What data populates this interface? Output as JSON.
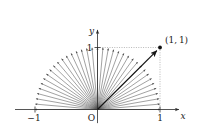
{
  "figure": {
    "background_color": "#ffffff",
    "ink_color": "#1a1a1a",
    "ray_color": "#555555",
    "guide_color": "#999999"
  },
  "axes": {
    "x_axis_label": "x",
    "y_axis_label": "y",
    "origin_label": "O",
    "x_ticks": [
      {
        "value": -1,
        "label": "−1"
      },
      {
        "value": 1,
        "label": "1"
      }
    ],
    "y_ticks": [
      {
        "value": 1,
        "label": "1"
      }
    ],
    "xlim": [
      -1.32,
      1.32
    ],
    "ylim": [
      -0.22,
      1.3
    ]
  },
  "point": {
    "label": "(1, 1)",
    "x": 1,
    "y": 1,
    "marker": "filled-dot"
  },
  "chart_data": {
    "type": "scatter",
    "title": "",
    "xlabel": "x",
    "ylabel": "y",
    "xlim": [
      -1.32,
      1.32
    ],
    "ylim": [
      -0.22,
      1.3
    ],
    "grid": false,
    "legend": null,
    "annotations": [
      {
        "text": "(1, 1)",
        "x": 1,
        "y": 1
      },
      {
        "text": "O",
        "x": 0,
        "y": 0
      },
      {
        "text": "−1",
        "x": -1,
        "y": 0
      },
      {
        "text": "1",
        "x": 1,
        "y": 0
      },
      {
        "text": "1",
        "x": 0,
        "y": 1
      }
    ],
    "series": [
      {
        "name": "unit-semicircle-vectors",
        "kind": "vector-fan",
        "count": 37,
        "radius": 1,
        "angle_start_deg": 0,
        "angle_end_deg": 180,
        "origin": [
          0,
          0
        ],
        "arrowheads": true
      },
      {
        "name": "highlighted-vector",
        "kind": "vector",
        "from": [
          0,
          0
        ],
        "to": [
          1,
          1
        ],
        "arrowhead": true,
        "emphasis": "bold"
      },
      {
        "name": "guide-lines",
        "kind": "dotted",
        "segments": [
          {
            "from": [
              0,
              1
            ],
            "to": [
              1,
              1
            ]
          },
          {
            "from": [
              1,
              1
            ],
            "to": [
              1,
              0
            ]
          }
        ]
      }
    ]
  }
}
